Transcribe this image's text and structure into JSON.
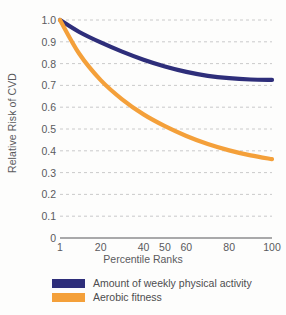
{
  "chart_data": {
    "type": "line",
    "title": "",
    "xlabel": "Percentile Ranks",
    "ylabel": "Relative Risk of CVD",
    "xlim": [
      1,
      100
    ],
    "ylim": [
      0,
      1.0
    ],
    "grid": true,
    "legend_position": "bottom-left",
    "xticks": [
      "1",
      "20",
      "40",
      "50",
      "60",
      "80",
      "100"
    ],
    "xtick_values": [
      1,
      20,
      40,
      50,
      60,
      80,
      100
    ],
    "yticks": [
      "1.0",
      "0.9",
      "0.8",
      "0.7",
      "0.6",
      "0.5",
      "0.4",
      "0.3",
      "0.2",
      "0.1",
      "0"
    ],
    "ytick_values": [
      1.0,
      0.9,
      0.8,
      0.7,
      0.6,
      0.5,
      0.4,
      0.3,
      0.2,
      0.1,
      0
    ],
    "x": [
      1,
      10,
      20,
      30,
      40,
      50,
      60,
      70,
      80,
      90,
      100
    ],
    "series": [
      {
        "name": "Amount of weekly physical activity",
        "color": "#2e2e7a",
        "values": [
          1.0,
          0.945,
          0.897,
          0.855,
          0.818,
          0.787,
          0.762,
          0.744,
          0.733,
          0.727,
          0.725
        ]
      },
      {
        "name": "Aerobic fitness",
        "color": "#f4a03a",
        "values": [
          1.0,
          0.845,
          0.724,
          0.636,
          0.567,
          0.513,
          0.468,
          0.431,
          0.402,
          0.379,
          0.362
        ]
      }
    ]
  },
  "legend": {
    "items": [
      {
        "label": "Amount of weekly physical activity",
        "color": "#2e2e7a"
      },
      {
        "label": "Aerobic fitness",
        "color": "#f4a03a"
      }
    ]
  },
  "colors": {
    "activity": "#2e2e7a",
    "fitness": "#f4a03a",
    "axis": "#8d8d8f",
    "grid": "#bcbcbe",
    "text": "#5a5a5c",
    "background": "#fdfdfc"
  }
}
